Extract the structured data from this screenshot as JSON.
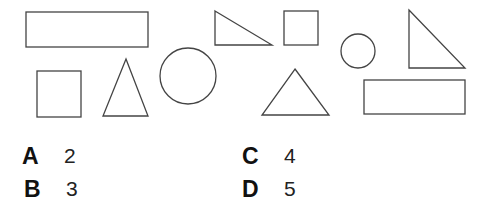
{
  "figure": {
    "stroke_color": "#444444",
    "shapes": [
      {
        "type": "rect",
        "label": "rectangle",
        "x": 26,
        "y": 12,
        "w": 122,
        "h": 35
      },
      {
        "type": "rect",
        "label": "square",
        "x": 37,
        "y": 71,
        "w": 44,
        "h": 46
      },
      {
        "type": "polygon",
        "label": "triangle",
        "points": "126,59 148,116 103,116"
      },
      {
        "type": "circle",
        "label": "circle",
        "cx": 188,
        "cy": 76,
        "r": 28
      },
      {
        "type": "polygon",
        "label": "triangle",
        "points": "215,11 272,45 215,45"
      },
      {
        "type": "rect",
        "label": "square",
        "x": 284,
        "y": 11,
        "w": 34,
        "h": 34
      },
      {
        "type": "polygon",
        "label": "triangle",
        "points": "295,69 329,115 262,115"
      },
      {
        "type": "circle",
        "label": "circle",
        "cx": 358,
        "cy": 51,
        "r": 17
      },
      {
        "type": "polygon",
        "label": "triangle",
        "points": "409,10 465,68 409,68"
      },
      {
        "type": "rect",
        "label": "rectangle",
        "x": 364,
        "y": 80,
        "w": 101,
        "h": 34
      }
    ]
  },
  "options": [
    {
      "letter": "A",
      "value": "2"
    },
    {
      "letter": "B",
      "value": "3"
    },
    {
      "letter": "C",
      "value": "4"
    },
    {
      "letter": "D",
      "value": "5"
    }
  ]
}
